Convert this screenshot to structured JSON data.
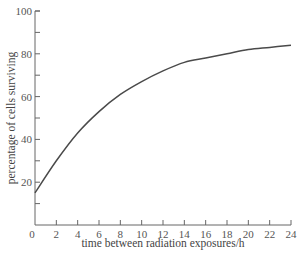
{
  "chart_data": {
    "type": "line",
    "title": "",
    "xlabel": "time between radiation exposures/h",
    "ylabel": "percentage of cells surviving",
    "xlim": [
      0,
      24
    ],
    "ylim": [
      0,
      100
    ],
    "xticks": [
      0,
      2,
      4,
      6,
      8,
      10,
      12,
      14,
      16,
      18,
      20,
      22,
      24
    ],
    "yticks_labeled": [
      20,
      40,
      60,
      80,
      100
    ],
    "yticks_minor": [
      10,
      30,
      50,
      70,
      90
    ],
    "grid": false,
    "legend": null,
    "series": [
      {
        "name": "cells surviving",
        "color": "#4a4a4a",
        "x": [
          0,
          2,
          4,
          6,
          8,
          10,
          12,
          14,
          16,
          18,
          20,
          22,
          24
        ],
        "y": [
          15,
          30,
          43,
          53,
          61,
          67,
          72,
          76,
          78,
          80,
          82,
          83,
          84
        ]
      }
    ]
  },
  "axes": {
    "x_label": "time between radiation exposures/h",
    "y_label": "percentage of cells surviving"
  }
}
